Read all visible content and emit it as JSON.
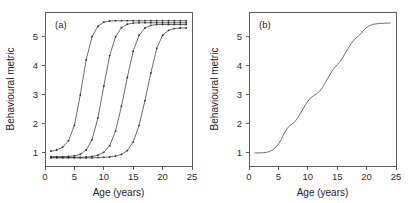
{
  "figure": {
    "background_color": "#ffffff",
    "axis_color": "#4a4a4a",
    "curve_color": "#3a3a3a",
    "marker_color": "#2e2e2e"
  },
  "chart_data": [
    {
      "type": "line",
      "panel_tag": "(a)",
      "title": "",
      "xlabel": "Age (years)",
      "ylabel": "Behavioural metric",
      "xlim": [
        0,
        25
      ],
      "ylim": [
        0.55,
        5.85
      ],
      "xticks": [
        0,
        5,
        10,
        15,
        20,
        25
      ],
      "xticklabels": [
        "0",
        "5",
        "10",
        "15",
        "20",
        "25"
      ],
      "yticks": [
        1,
        2,
        3,
        4,
        5
      ],
      "yticklabels": [
        "1",
        "2",
        "3",
        "4",
        "5"
      ],
      "grid": false,
      "legend": "none",
      "markers": "dot",
      "x": [
        1,
        2,
        3,
        4,
        5,
        6,
        7,
        8,
        9,
        10,
        11,
        12,
        13,
        14,
        15,
        16,
        17,
        18,
        19,
        20,
        21,
        22,
        23,
        24
      ],
      "series": [
        {
          "name": "cohort-1",
          "midpoint_age": 6,
          "plateau_low": 1.05,
          "plateau_high": 5.55,
          "values": [
            1.06,
            1.1,
            1.2,
            1.42,
            1.95,
            3.0,
            4.2,
            5.0,
            5.36,
            5.5,
            5.54,
            5.55,
            5.55,
            5.55,
            5.55,
            5.55,
            5.55,
            5.55,
            5.55,
            5.55,
            5.55,
            5.55,
            5.55,
            5.55
          ]
        },
        {
          "name": "cohort-2",
          "midpoint_age": 10.5,
          "plateau_low": 0.87,
          "plateau_high": 5.48,
          "values": [
            0.87,
            0.87,
            0.87,
            0.88,
            0.9,
            0.95,
            1.1,
            1.45,
            2.2,
            3.3,
            4.35,
            5.0,
            5.31,
            5.43,
            5.47,
            5.48,
            5.48,
            5.48,
            5.48,
            5.48,
            5.48,
            5.48,
            5.48,
            5.48
          ]
        },
        {
          "name": "cohort-3",
          "midpoint_age": 14.5,
          "plateau_low": 0.85,
          "plateau_high": 5.42,
          "values": [
            0.85,
            0.85,
            0.85,
            0.85,
            0.85,
            0.85,
            0.86,
            0.88,
            0.92,
            1.02,
            1.25,
            1.75,
            2.6,
            3.6,
            4.5,
            5.05,
            5.3,
            5.39,
            5.42,
            5.42,
            5.42,
            5.42,
            5.42,
            5.42
          ]
        },
        {
          "name": "cohort-4",
          "midpoint_age": 18.5,
          "plateau_low": 0.83,
          "plateau_high": 5.3,
          "values": [
            0.83,
            0.83,
            0.83,
            0.83,
            0.83,
            0.83,
            0.83,
            0.83,
            0.84,
            0.85,
            0.86,
            0.89,
            0.95,
            1.08,
            1.38,
            1.95,
            2.8,
            3.75,
            4.6,
            5.05,
            5.22,
            5.28,
            5.3,
            5.3
          ]
        }
      ]
    },
    {
      "type": "line",
      "panel_tag": "(b)",
      "title": "",
      "xlabel": "Age (years)",
      "ylabel": "Behavioural metric",
      "xlim": [
        0,
        25
      ],
      "ylim": [
        0.55,
        5.85
      ],
      "xticks": [
        0,
        5,
        10,
        15,
        20,
        25
      ],
      "xticklabels": [
        "0",
        "5",
        "10",
        "15",
        "20",
        "25"
      ],
      "yticks": [
        1,
        2,
        3,
        4,
        5
      ],
      "yticklabels": [
        "1",
        "2",
        "3",
        "4",
        "5"
      ],
      "grid": false,
      "legend": "none",
      "markers": "none",
      "series": [
        {
          "name": "population-average",
          "x": [
            1.0,
            1.5,
            2.0,
            2.5,
            3.0,
            3.5,
            4.0,
            4.5,
            5.0,
            5.5,
            6.0,
            6.5,
            7.0,
            7.5,
            8.0,
            8.5,
            9.0,
            9.5,
            10.0,
            10.5,
            11.0,
            11.5,
            12.0,
            12.5,
            13.0,
            13.5,
            14.0,
            14.5,
            15.0,
            15.5,
            16.0,
            16.5,
            17.0,
            17.5,
            18.0,
            18.5,
            19.0,
            19.5,
            20.0,
            20.5,
            21.0,
            21.5,
            22.0,
            22.5,
            23.0,
            23.5,
            24.0
          ],
          "values": [
            1.0,
            1.0,
            1.0,
            1.01,
            1.02,
            1.05,
            1.1,
            1.18,
            1.3,
            1.47,
            1.68,
            1.85,
            1.95,
            2.02,
            2.12,
            2.28,
            2.45,
            2.62,
            2.78,
            2.9,
            2.97,
            3.03,
            3.12,
            3.25,
            3.42,
            3.6,
            3.78,
            3.92,
            4.03,
            4.15,
            4.3,
            4.48,
            4.65,
            4.8,
            4.92,
            5.0,
            5.1,
            5.22,
            5.32,
            5.38,
            5.42,
            5.44,
            5.45,
            5.46,
            5.46,
            5.47,
            5.47
          ]
        }
      ]
    }
  ]
}
